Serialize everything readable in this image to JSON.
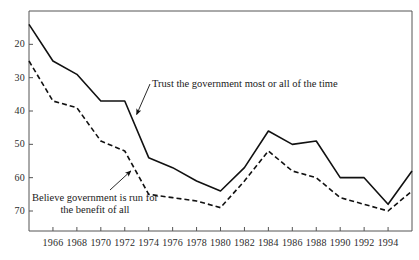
{
  "chart_data": {
    "type": "line",
    "title": "",
    "subtitle": "",
    "xlabel": "",
    "ylabel": "",
    "xlim": [
      1964,
      1996
    ],
    "ylim": [
      14,
      80
    ],
    "grid": false,
    "legend_position": "inline-annotations",
    "x_ticks": [
      1966,
      1968,
      1970,
      1972,
      1974,
      1976,
      1978,
      1980,
      1982,
      1984,
      1986,
      1988,
      1990,
      1992,
      1994
    ],
    "y_ticks": [
      20,
      30,
      40,
      50,
      60,
      70
    ],
    "x": [
      1964,
      1966,
      1968,
      1970,
      1972,
      1974,
      1976,
      1978,
      1980,
      1982,
      1984,
      1986,
      1988,
      1990,
      1992,
      1994,
      1996
    ],
    "series": [
      {
        "name": "Trust the government most or all of the time",
        "style": "solid",
        "color": "#111111",
        "values": [
          76,
          65,
          61,
          53,
          53,
          36,
          33,
          29,
          26,
          33,
          44,
          40,
          41,
          30,
          30,
          22,
          32
        ]
      },
      {
        "name": "Believe government is run for the benefit of all",
        "style": "dashed",
        "color": "#111111",
        "values": [
          65,
          53,
          51,
          41,
          38,
          25,
          24,
          23,
          21,
          29,
          38,
          32,
          30,
          24,
          22,
          20,
          26
        ]
      }
    ],
    "annotations": [
      {
        "id": "trust-annotation",
        "text": "Trust the government most or all of the time",
        "lines": [
          "Trust the government most or all of the time"
        ],
        "target_x": 1973,
        "target_y": 49
      },
      {
        "id": "benefit-annotation",
        "text": "Believe government is run for the benefit of all",
        "lines": [
          "Believe government is run for",
          "the benefit of all"
        ],
        "target_x": 1972.5,
        "target_y": 32
      }
    ]
  },
  "axis": {
    "y_tick_labels": [
      "70",
      "60",
      "50",
      "40",
      "30",
      "20"
    ],
    "x_tick_labels": [
      "1966",
      "1968",
      "1970",
      "1972",
      "1974",
      "1976",
      "1978",
      "1980",
      "1982",
      "1984",
      "1986",
      "1988",
      "1990",
      "1992",
      "1994"
    ]
  },
  "annotations": {
    "trust_line_1": "Trust the government most or all of the time",
    "benefit_line_1": "Believe government is run for",
    "benefit_line_2": "the benefit of all"
  },
  "colors": {
    "ink": "#111111",
    "frame": "#555555",
    "background": "#ffffff"
  }
}
